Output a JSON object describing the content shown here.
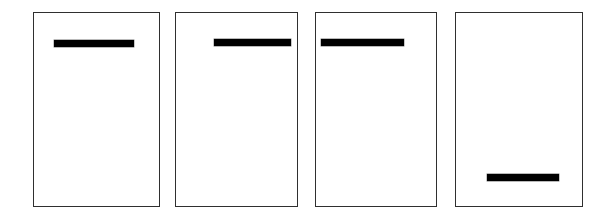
{
  "figure": {
    "canvas": {
      "width": 614,
      "height": 219,
      "background_color": "#ffffff"
    },
    "style": {
      "frame_color": "#1a1a1a",
      "frame_thickness": 1.6,
      "bar_color": "#000000",
      "panel_fill": "#ffffff"
    },
    "panels": [
      {
        "id": "panel-1",
        "index": 1,
        "frame": {
          "x": 33,
          "y": 12,
          "width": 127,
          "height": 195
        },
        "bar": {
          "x": 55,
          "y": 41,
          "width": 80,
          "height": 7
        },
        "bar_position": "upper-center",
        "bar_label": ""
      },
      {
        "id": "panel-2",
        "index": 2,
        "frame": {
          "x": 175,
          "y": 12,
          "width": 123,
          "height": 195
        },
        "bar": {
          "x": 215,
          "y": 40,
          "width": 77,
          "height": 7
        },
        "bar_position": "upper-right",
        "bar_label": ""
      },
      {
        "id": "panel-3",
        "index": 3,
        "frame": {
          "x": 315,
          "y": 12,
          "width": 122,
          "height": 195
        },
        "bar": {
          "x": 322,
          "y": 40,
          "width": 83,
          "height": 7
        },
        "bar_position": "upper-left",
        "bar_label": ""
      },
      {
        "id": "panel-4",
        "index": 4,
        "frame": {
          "x": 455,
          "y": 12,
          "width": 128,
          "height": 195
        },
        "bar": {
          "x": 488,
          "y": 175,
          "width": 72,
          "height": 7
        },
        "bar_position": "lower-center",
        "bar_label": ""
      }
    ]
  }
}
